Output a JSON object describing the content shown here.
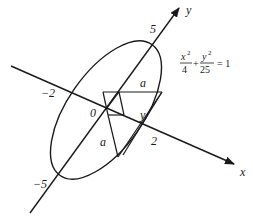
{
  "diagram": {
    "type": "geometry",
    "axes": {
      "x_label": "x",
      "y_label": "y",
      "origin_label": "0"
    },
    "ticks": {
      "y_pos": "5",
      "y_neg": "−5",
      "x_neg": "−2",
      "x_pos": "2"
    },
    "segment_labels": {
      "a_top": "a",
      "a_left": "a",
      "y_mid": "y"
    },
    "equation": {
      "x_num": "x",
      "x_exp": "2",
      "x_den": "4",
      "plus": "+",
      "y_num": "y",
      "y_exp": "2",
      "y_den": "25",
      "rhs": "= 1"
    },
    "colors": {
      "stroke": "#1a1a1a",
      "background": "#ffffff"
    }
  }
}
